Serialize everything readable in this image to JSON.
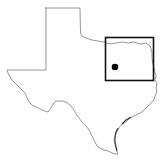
{
  "map": {
    "region": "Texas",
    "description": "Locator map of Texas with a rectangle highlighting a north-central/northeast region and a dot marking a location",
    "colors": {
      "background": "#ffffff",
      "outline": "#8a8a8a",
      "highlight_box": "#111111",
      "marker": "#000000"
    },
    "highlight_box": {
      "x": 105,
      "y": 37,
      "width": 48,
      "height": 43
    },
    "marker": {
      "cx": 115,
      "cy": 67,
      "r": 3.3
    }
  }
}
